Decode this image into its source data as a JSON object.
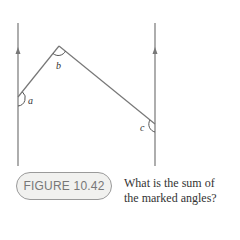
{
  "figure": {
    "label": "FIGURE 10.42",
    "caption_line1": "What is the sum of",
    "caption_line2": "the marked angles?"
  },
  "angles": {
    "a": "a",
    "b": "b",
    "c": "c"
  },
  "colors": {
    "line": "#777777",
    "badge_bg": "#f1f1ef",
    "badge_border": "#9a9a9a",
    "badge_text": "#777777",
    "text": "#333333"
  }
}
